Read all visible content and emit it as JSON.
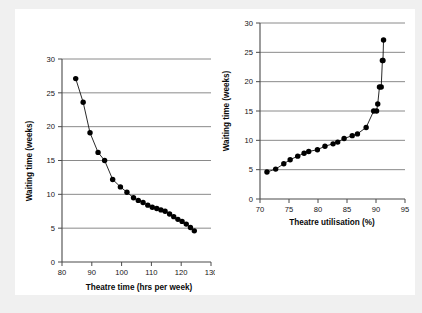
{
  "figure": {
    "background_color": "#f0f0f0",
    "panel_color": "#ffffff",
    "marker_color": "#000000",
    "gridline_color": "#7d7d7d"
  },
  "chart_data": [
    {
      "type": "scatter",
      "id": "theatre-time",
      "title": "",
      "xlabel": "Theatre time (hrs per week)",
      "ylabel": "Waiting time (weeks)",
      "xlim": [
        80,
        130
      ],
      "ylim": [
        0,
        30
      ],
      "xticks": [
        80,
        90,
        100,
        110,
        120,
        130
      ],
      "yticks": [
        0,
        5,
        10,
        15,
        20,
        25,
        30
      ],
      "xtick_labels": [
        "80",
        "90",
        "100",
        "110",
        "120",
        "130"
      ],
      "ytick_labels": [
        "0",
        "5",
        "10",
        "15",
        "20",
        "25",
        "30"
      ],
      "grid": "horizontal",
      "connected": true,
      "legend": "none",
      "x": [
        84.6,
        87.1,
        89.4,
        92.1,
        94.3,
        97.0,
        99.6,
        101.8,
        104.0,
        105.6,
        107.2,
        108.8,
        110.3,
        111.8,
        113.2,
        114.6,
        116.1,
        117.5,
        118.9,
        120.3,
        121.7,
        123.1,
        124.4
      ],
      "y": [
        27.1,
        23.6,
        19.1,
        16.2,
        15.0,
        12.2,
        11.1,
        10.3,
        9.5,
        9.1,
        8.8,
        8.4,
        8.1,
        7.9,
        7.7,
        7.5,
        7.1,
        6.7,
        6.3,
        6.0,
        5.6,
        5.1,
        4.6
      ]
    },
    {
      "type": "scatter",
      "id": "theatre-utilisation",
      "title": "",
      "xlabel": "Theatre utilisation (%)",
      "ylabel": "Waiting time (weeks)",
      "xlim": [
        70,
        95
      ],
      "ylim": [
        0,
        30
      ],
      "xticks": [
        70,
        75,
        80,
        85,
        90,
        95
      ],
      "yticks": [
        0,
        5,
        10,
        15,
        20,
        25,
        30
      ],
      "xtick_labels": [
        "70",
        "75",
        "80",
        "85",
        "90",
        "95"
      ],
      "ytick_labels": [
        "0",
        "5",
        "10",
        "15",
        "20",
        "25",
        "30"
      ],
      "grid": "horizontal",
      "connected": true,
      "legend": "none",
      "x": [
        71.2,
        72.7,
        74.1,
        75.2,
        76.5,
        77.6,
        78.4,
        79.9,
        81.2,
        82.6,
        83.4,
        84.5,
        85.9,
        86.8,
        88.3,
        89.6,
        90.1,
        90.3,
        90.6,
        90.9,
        91.1,
        91.2,
        91.3
      ],
      "y": [
        4.6,
        5.1,
        6.0,
        6.7,
        7.3,
        7.8,
        8.1,
        8.4,
        9.0,
        9.4,
        9.7,
        10.3,
        10.8,
        11.1,
        12.2,
        15.0,
        15.0,
        16.2,
        19.1,
        19.1,
        23.6,
        23.6,
        27.1
      ]
    }
  ]
}
